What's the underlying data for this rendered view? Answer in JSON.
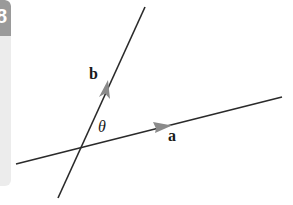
{
  "side_panel": {
    "glyph": "8",
    "header_color": "#9a9a9a",
    "body_color": "#ececec"
  },
  "diagram": {
    "line_color": "#2a2a2a",
    "arrow_color": "#8a8a8a",
    "vectors": [
      {
        "name": "a",
        "label": "a"
      },
      {
        "name": "b",
        "label": "b"
      }
    ],
    "angle_label": "θ"
  }
}
